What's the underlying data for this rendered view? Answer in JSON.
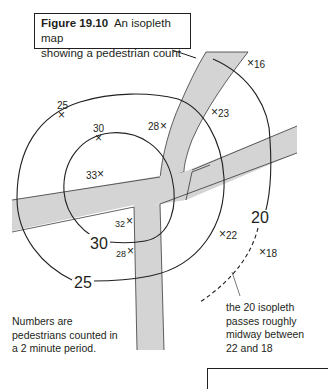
{
  "caption": {
    "figure_label": "Figure 19.10",
    "title": "An isopleth map",
    "title_line2": "showing a pedestrian count"
  },
  "isopleths": [
    {
      "value": "30",
      "label": "30"
    },
    {
      "value": "25",
      "label": "25"
    },
    {
      "value": "20",
      "label": "20",
      "extrapolated_dashed": true
    }
  ],
  "points": [
    {
      "id": "p16",
      "value": "16"
    },
    {
      "id": "p23",
      "value": "23"
    },
    {
      "id": "p25",
      "value": "25"
    },
    {
      "id": "p30",
      "value": "30"
    },
    {
      "id": "p28a",
      "value": "28"
    },
    {
      "id": "p33",
      "value": "33"
    },
    {
      "id": "p32",
      "value": "32"
    },
    {
      "id": "p28b",
      "value": "28"
    },
    {
      "id": "p22",
      "value": "22"
    },
    {
      "id": "p18",
      "value": "18"
    }
  ],
  "notes": {
    "legend_line1": "Numbers are",
    "legend_line2": "pedestrians counted in",
    "legend_line3": "a 2 minute period.",
    "annotation_line1": "the 20 isopleth",
    "annotation_line2": "passes roughly",
    "annotation_line3": "midway between",
    "annotation_line4": "22 and 18"
  },
  "colors": {
    "road_fill": "#d4d4d4",
    "line": "#231f20"
  }
}
